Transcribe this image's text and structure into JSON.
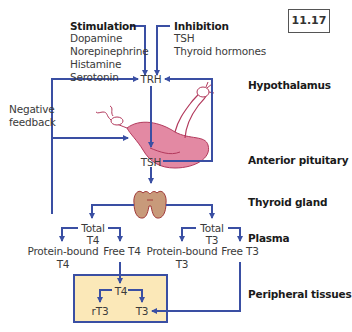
{
  "figure_number": "11.17",
  "colors": {
    "arrow": "#3a4fa3",
    "pituitary_fill": "#e389a3",
    "pituitary_stroke": "#b2395c",
    "thyroid_fill": "#c89a7a",
    "thyroid_stroke": "#a13a3a",
    "tissue_box_fill": "#fbe8b8"
  },
  "stimulation": {
    "title": "Stimulation",
    "items": [
      "Dopamine",
      "Norepinephrine",
      "Histamine",
      "Serotonin"
    ]
  },
  "inhibition": {
    "title": "Inhibition",
    "items": [
      "TSH",
      "Thyroid hormones"
    ]
  },
  "feedback": {
    "line1": "Negative",
    "line2": "feedback"
  },
  "nodes": {
    "trh": "TRH",
    "tsh": "TSH",
    "total_t4_1": "Total",
    "total_t4_2": "T4",
    "total_t3_1": "Total",
    "total_t3_2": "T3",
    "pb_t4_1": "Protein-bound",
    "pb_t4_2": "T4",
    "free_t4": "Free T4",
    "pb_t3_1": "Protein-bound",
    "pb_t3_2": "T3",
    "free_t3": "Free T3",
    "tissue_t4": "T4",
    "tissue_rt3": "rT3",
    "tissue_t3": "T3"
  },
  "levels": {
    "hypothalamus": "Hypothalamus",
    "anterior_pituitary": "Anterior pituitary",
    "thyroid_gland": "Thyroid gland",
    "plasma": "Plasma",
    "peripheral_tissues": "Peripheral tissues"
  }
}
